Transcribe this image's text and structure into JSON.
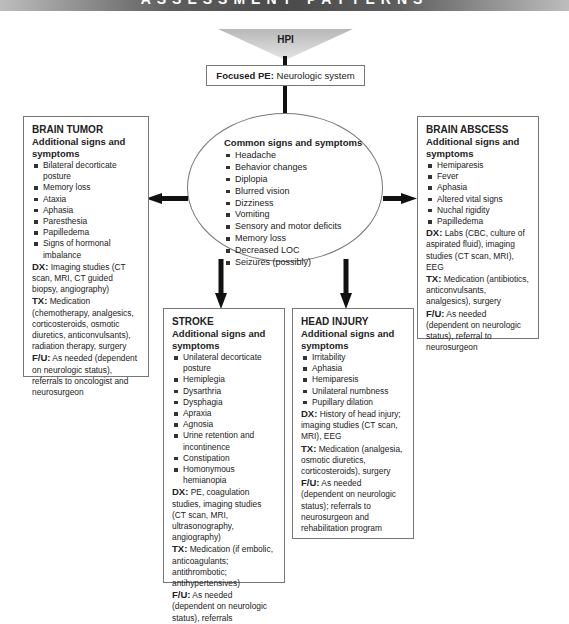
{
  "banner": {
    "title": "ASSESSMENT PATTERNS"
  },
  "hpi": {
    "label": "HPI",
    "color": "#c9c9c9"
  },
  "focused_pe": {
    "label": "Focused PE:",
    "value": "Neurologic system"
  },
  "common": {
    "title": "Common signs and symptoms",
    "items": [
      "Headache",
      "Behavior changes",
      "Diplopia",
      "Blurred vision",
      "Dizziness",
      "Vomiting",
      "Sensory and motor deficits",
      "Memory loss",
      "Decreased LOC",
      "Seizures (possibly)"
    ]
  },
  "brain_tumor": {
    "title": "BRAIN TUMOR",
    "subtitle": "Additional signs and symptoms",
    "items": [
      "Bilateral decorticate posture",
      "Memory loss",
      "Ataxia",
      "Aphasia",
      "Paresthesia",
      "Papilledema",
      "Signs of hormonal imbalance"
    ],
    "dx_label": "DX:",
    "dx": "Imaging studies (CT scan, MRI, CT guided biopsy, angiography)",
    "tx_label": "TX:",
    "tx": "Medication (chemotherapy, analgesics, corticosteroids, osmotic diuretics, anticonvulsants), radiation therapy, surgery",
    "fu_label": "F/U:",
    "fu": "As needed (dependent on neurologic status), referrals to oncologist and neurosurgeon"
  },
  "brain_abscess": {
    "title": "BRAIN ABSCESS",
    "subtitle": "Additional signs and symptoms",
    "items": [
      "Hemiparesis",
      "Fever",
      "Aphasia",
      "Altered vital signs",
      "Nuchal rigidity",
      "Papilledema"
    ],
    "dx_label": "DX:",
    "dx": "Labs (CBC, culture of aspirated fluid), imaging studies (CT scan, MRI), EEG",
    "tx_label": "TX:",
    "tx": "Medication (antibiotics, anticonvulsants, analgesics), surgery",
    "fu_label": "F/U:",
    "fu": "As needed (dependent on neurologic status), referral to neurosurgeon"
  },
  "stroke": {
    "title": "STROKE",
    "subtitle": "Additional signs and symptoms",
    "items": [
      "Unilateral decorticate posture",
      "Hemiplegia",
      "Dysarthria",
      "Dysphagia",
      "Apraxia",
      "Agnosia",
      "Urine retention and incontinence",
      "Constipation",
      "Homonymous hemianopia"
    ],
    "dx_label": "DX:",
    "dx": "PE, coagulation studies, imaging studies (CT scan, MRI, ultrasonography, angiography)",
    "tx_label": "TX:",
    "tx": "Medication (if embolic, anticoagulants; antithrombotic; antihypertensives)",
    "fu_label": "F/U:",
    "fu": "As needed (dependent on neurologic status), referrals"
  },
  "head_injury": {
    "title": "HEAD INJURY",
    "subtitle": "Additional signs and symptoms",
    "items": [
      "Irritability",
      "Aphasia",
      "Hemiparesis",
      "Unilateral numbness",
      "Pupillary dilation"
    ],
    "dx_label": "DX:",
    "dx": "History of head injury; imaging studies (CT scan, MRI), EEG",
    "tx_label": "TX:",
    "tx": "Medication (analgesia, osmotic diuretics, corticosteroids), surgery",
    "fu_label": "F/U:",
    "fu": "As needed (dependent on neurologic status); referrals to neurosurgeon and rehabilitation program"
  }
}
